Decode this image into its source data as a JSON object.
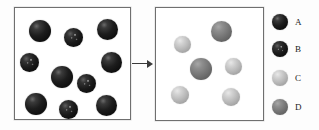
{
  "figure": {
    "type": "particle-diagram",
    "background_color": "#ffffff"
  },
  "boxes": [
    {
      "id": "before",
      "name": "reactant-box",
      "border_color": "#6f6f6f",
      "particles": [
        {
          "species": "A",
          "x": 14,
          "y": 12,
          "d": 22
        },
        {
          "species": "B",
          "x": 49,
          "y": 20,
          "d": 19
        },
        {
          "species": "A",
          "x": 82,
          "y": 11,
          "d": 21
        },
        {
          "species": "B",
          "x": 5,
          "y": 45,
          "d": 19
        },
        {
          "species": "A",
          "x": 86,
          "y": 44,
          "d": 21
        },
        {
          "species": "A",
          "x": 36,
          "y": 58,
          "d": 22
        },
        {
          "species": "B",
          "x": 62,
          "y": 66,
          "d": 19
        },
        {
          "species": "A",
          "x": 10,
          "y": 85,
          "d": 22
        },
        {
          "species": "B",
          "x": 44,
          "y": 92,
          "d": 19
        },
        {
          "species": "A",
          "x": 81,
          "y": 87,
          "d": 21
        }
      ]
    },
    {
      "id": "after",
      "name": "product-box",
      "border_color": "#6f6f6f",
      "particles": [
        {
          "species": "D",
          "x": 55,
          "y": 13,
          "d": 21
        },
        {
          "species": "C",
          "x": 18,
          "y": 28,
          "d": 17
        },
        {
          "species": "D",
          "x": 34,
          "y": 50,
          "d": 22
        },
        {
          "species": "C",
          "x": 69,
          "y": 50,
          "d": 17
        },
        {
          "species": "C",
          "x": 15,
          "y": 78,
          "d": 18
        },
        {
          "species": "C",
          "x": 66,
          "y": 80,
          "d": 18
        }
      ]
    }
  ],
  "arrow": {
    "name": "reaction-arrow",
    "direction": "right",
    "color": "#3a3a3a"
  },
  "legend": {
    "items": [
      {
        "label": "A",
        "species": "A",
        "color": "#141414",
        "description": "darkest black sphere"
      },
      {
        "label": "B",
        "species": "B",
        "color": "#1a1a1a",
        "description": "dark speckled sphere"
      },
      {
        "label": "C",
        "species": "C",
        "color": "#bdbdbd",
        "description": "light gray sphere"
      },
      {
        "label": "D",
        "species": "D",
        "color": "#7a7a7a",
        "description": "medium gray sphere"
      }
    ],
    "row_tops": [
      4,
      31,
      60,
      89
    ]
  },
  "chart_data": {
    "type": "table",
    "categories": [
      "A",
      "B",
      "C",
      "D"
    ],
    "series": [
      {
        "name": "Before (left box)",
        "values": [
          6,
          4,
          0,
          0
        ]
      },
      {
        "name": "After (right box)",
        "values": [
          0,
          0,
          4,
          2
        ]
      }
    ],
    "xlabel": "Particle type",
    "ylabel": "Count",
    "legend_position": "right"
  }
}
